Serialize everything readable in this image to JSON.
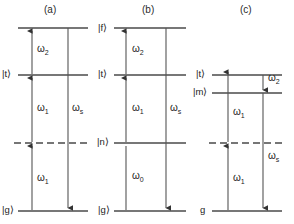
{
  "figure": {
    "background": "#ffffff",
    "line_color": "#4a4a4a",
    "text_color": "#1c1c1c"
  },
  "panels": [
    {
      "id": "a",
      "label": "(a)",
      "levels": [
        {
          "name": "upper",
          "label": "",
          "style": "solid",
          "y": 28
        },
        {
          "name": "t",
          "label": "|t⟩",
          "style": "solid",
          "y": 75
        },
        {
          "name": "virtual",
          "label": "",
          "style": "dashed",
          "y": 143
        },
        {
          "name": "g",
          "label": "|g⟩",
          "style": "solid",
          "y": 211
        }
      ],
      "transitions": [
        {
          "name": "omega2-up",
          "label": "ω",
          "sub": "2",
          "direction": "up",
          "from_y": 75,
          "to_y": 28
        },
        {
          "name": "omega1-mid-up",
          "label": "ω",
          "sub": "1",
          "direction": "up",
          "from_y": 143,
          "to_y": 75
        },
        {
          "name": "omega1-low-up",
          "label": "ω",
          "sub": "1",
          "direction": "up",
          "from_y": 211,
          "to_y": 143
        },
        {
          "name": "omegas-down",
          "label": "ω",
          "sub": "s",
          "direction": "down",
          "from_y": 28,
          "to_y": 211
        }
      ]
    },
    {
      "id": "b",
      "label": "(b)",
      "levels": [
        {
          "name": "f",
          "label": "|f⟩",
          "style": "solid",
          "y": 28
        },
        {
          "name": "t",
          "label": "|t⟩",
          "style": "solid",
          "y": 75
        },
        {
          "name": "n",
          "label": "|n⟩",
          "style": "solid",
          "y": 143
        },
        {
          "name": "g",
          "label": "|g⟩",
          "style": "solid",
          "y": 211
        }
      ],
      "transitions": [
        {
          "name": "omega2-up",
          "label": "ω",
          "sub": "2",
          "direction": "up",
          "from_y": 75,
          "to_y": 28
        },
        {
          "name": "omega1-up",
          "label": "ω",
          "sub": "1",
          "direction": "up",
          "from_y": 143,
          "to_y": 75
        },
        {
          "name": "omega0-up",
          "label": "ω",
          "sub": "0",
          "direction": "up",
          "from_y": 211,
          "to_y": 143
        },
        {
          "name": "omegas-down",
          "label": "ω",
          "sub": "s",
          "direction": "down",
          "from_y": 28,
          "to_y": 211
        }
      ]
    },
    {
      "id": "c",
      "label": "(c)",
      "levels": [
        {
          "name": "t",
          "label": "|t⟩",
          "style": "solid",
          "y": 75
        },
        {
          "name": "m",
          "label": "|m⟩",
          "style": "solid",
          "y": 93
        },
        {
          "name": "virtual",
          "label": "",
          "style": "dashed",
          "y": 143
        },
        {
          "name": "g",
          "label": "g",
          "style": "solid",
          "y": 211
        }
      ],
      "transitions": [
        {
          "name": "omega2-down",
          "label": "ω",
          "sub": "2",
          "direction": "down",
          "from_y": 75,
          "to_y": 93
        },
        {
          "name": "omega1-mid-up",
          "label": "ω",
          "sub": "1",
          "direction": "up",
          "from_y": 143,
          "to_y": 75
        },
        {
          "name": "omega1-low-up",
          "label": "ω",
          "sub": "1",
          "direction": "up",
          "from_y": 211,
          "to_y": 143
        },
        {
          "name": "omegas-down",
          "label": "ω",
          "sub": "s",
          "direction": "down",
          "from_y": 93,
          "to_y": 211
        }
      ]
    }
  ],
  "labels": {
    "panel_a": "(a)",
    "panel_b": "(b)",
    "panel_c": "(c)",
    "a_state_t": "|t⟩",
    "a_state_g": "|g⟩",
    "b_state_f": "|f⟩",
    "b_state_t": "|t⟩",
    "b_state_n": "|n⟩",
    "b_state_g": "|g⟩",
    "c_state_t": "|t⟩",
    "c_state_m": "|m⟩",
    "c_state_g": "g",
    "omega": "ω",
    "sub_0": "0",
    "sub_1": "1",
    "sub_2": "2",
    "sub_s": "s"
  }
}
